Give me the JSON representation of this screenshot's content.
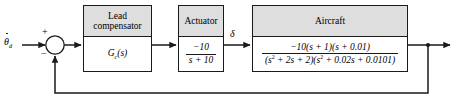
{
  "diagram": {
    "type": "control-system-block-diagram",
    "line_color": "#1a1a1a",
    "header_fill": "#dedede",
    "background": "#ffffff"
  },
  "input": {
    "label_symbol": "θ",
    "label_subscript": "d",
    "has_dot_accent": true,
    "description": "commanded pitch rate input"
  },
  "summing_junction": {
    "name": "summing-junction",
    "plus_sign": "+",
    "minus_sign": "−",
    "plus_position": "upper-left",
    "minus_position": "lower-left"
  },
  "blocks": [
    {
      "id": "lead-compensator",
      "header_lines": [
        "Lead",
        "compensator"
      ],
      "body": {
        "kind": "expression",
        "text": "G",
        "subscript": "c",
        "suffix": "(s)"
      }
    },
    {
      "id": "actuator",
      "header_lines": [
        "Actuator"
      ],
      "body": {
        "kind": "fraction",
        "numerator": "−10",
        "denominator": "s + 10"
      }
    },
    {
      "id": "aircraft",
      "header_lines": [
        "Aircraft"
      ],
      "body": {
        "kind": "fraction",
        "numerator": "−10(s + 1)(s + 0.01)",
        "denominator_parts": [
          {
            "text": "(s"
          },
          {
            "sup": "2"
          },
          {
            "text": " + 2s + 2)(s"
          },
          {
            "sup": "2"
          },
          {
            "text": " + 0.02s + 0.0101)"
          }
        ],
        "denominator_plain": "(s^2 + 2s + 2)(s^2 + 0.02s + 0.0101)"
      }
    }
  ],
  "signals": [
    {
      "id": "delta",
      "label": "δ",
      "between": [
        "actuator",
        "aircraft"
      ]
    }
  ],
  "feedback": {
    "name": "feedback-path",
    "description": "unity feedback from output takeoff point to negative input of summing junction",
    "gain": "1"
  },
  "output": {
    "name": "output-arrow",
    "description": "system output to the right"
  },
  "caption": {
    "text": ""
  }
}
